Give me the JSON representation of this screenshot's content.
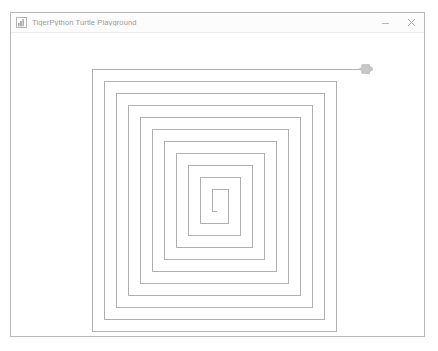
{
  "window": {
    "title": "TigerPython Turtle Playground",
    "icon": "app-icon",
    "controls": {
      "minimize_label": "Minimize",
      "minimize_icon": "minimize-icon",
      "close_label": "Close",
      "close_icon": "close-icon"
    }
  },
  "canvas": {
    "background_color": "#ffffff",
    "pen_color": "#b0b0b0",
    "pen_width": 1,
    "turtle": {
      "name": "turtle-marker",
      "color": "#c8c8c8",
      "outline_color": "#b4b4b4",
      "x": 355,
      "y": 36,
      "heading_degrees": 0
    },
    "drawing": {
      "type": "square-spiral",
      "turns": 11,
      "spacing": 12,
      "start_x": 355,
      "start_y": 36,
      "points": [
        [
          355,
          36
        ],
        [
          81,
          36
        ],
        [
          81,
          298
        ],
        [
          325,
          298
        ],
        [
          325,
          48
        ],
        [
          93,
          48
        ],
        [
          93,
          286
        ],
        [
          313,
          286
        ],
        [
          313,
          60
        ],
        [
          105,
          60
        ],
        [
          105,
          274
        ],
        [
          301,
          274
        ],
        [
          301,
          72
        ],
        [
          117,
          72
        ],
        [
          117,
          262
        ],
        [
          289,
          262
        ],
        [
          289,
          84
        ],
        [
          129,
          84
        ],
        [
          129,
          250
        ],
        [
          277,
          250
        ],
        [
          277,
          96
        ],
        [
          141,
          96
        ],
        [
          141,
          238
        ],
        [
          265,
          238
        ],
        [
          265,
          108
        ],
        [
          153,
          108
        ],
        [
          153,
          226
        ],
        [
          253,
          226
        ],
        [
          253,
          120
        ],
        [
          165,
          120
        ],
        [
          165,
          214
        ],
        [
          241,
          214
        ],
        [
          241,
          132
        ],
        [
          177,
          132
        ],
        [
          177,
          202
        ],
        [
          229,
          202
        ],
        [
          229,
          144
        ],
        [
          189,
          144
        ],
        [
          189,
          190
        ],
        [
          217,
          190
        ],
        [
          217,
          156
        ],
        [
          201,
          156
        ],
        [
          201,
          178
        ],
        [
          205,
          178
        ]
      ]
    }
  }
}
